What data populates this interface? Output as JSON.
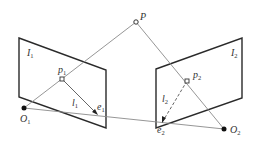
{
  "diagram": {
    "labels": {
      "P": "P",
      "I1": "I",
      "I1_sub": "1",
      "I2": "I",
      "I2_sub": "2",
      "p1": "p",
      "p1_sub": "1",
      "p2": "p",
      "p2_sub": "2",
      "l1": "l",
      "l1_sub": "1",
      "l2": "l",
      "l2_sub": "2",
      "e1": "e",
      "e1_sub": "1",
      "e2": "e",
      "e2_sub": "2",
      "O1": "O",
      "O1_sub": "1",
      "O2": "O",
      "O2_sub": "2"
    },
    "colors": {
      "plane_stroke": "#2a2a2a",
      "ray_stroke": "#8a8a8a",
      "point_fill": "#111111",
      "text": "#333333"
    }
  }
}
